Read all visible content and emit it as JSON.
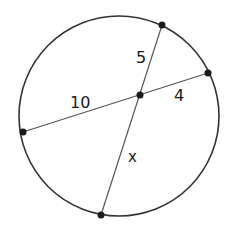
{
  "diagram": {
    "type": "intersecting-chords",
    "circle": {
      "cx": 119,
      "cy": 116,
      "r": 100,
      "stroke": "#333333"
    },
    "points": {
      "top": {
        "x": 162,
        "y": 25
      },
      "right": {
        "x": 208,
        "y": 73
      },
      "left": {
        "x": 23,
        "y": 132
      },
      "bottom": {
        "x": 101,
        "y": 215
      },
      "intersection": {
        "x": 140,
        "y": 95
      }
    },
    "chords": [
      {
        "name": "chord-left-right",
        "from": "left",
        "to": "right",
        "segments": [
          "10",
          "4"
        ]
      },
      {
        "name": "chord-top-bottom",
        "from": "top",
        "to": "bottom",
        "segments": [
          "5",
          "x"
        ]
      }
    ],
    "labels": {
      "seg_top": "5",
      "seg_right": "4",
      "seg_left": "10",
      "seg_bottom": "x"
    },
    "line_color": "#555555",
    "point_color": "#1a1a1a"
  }
}
